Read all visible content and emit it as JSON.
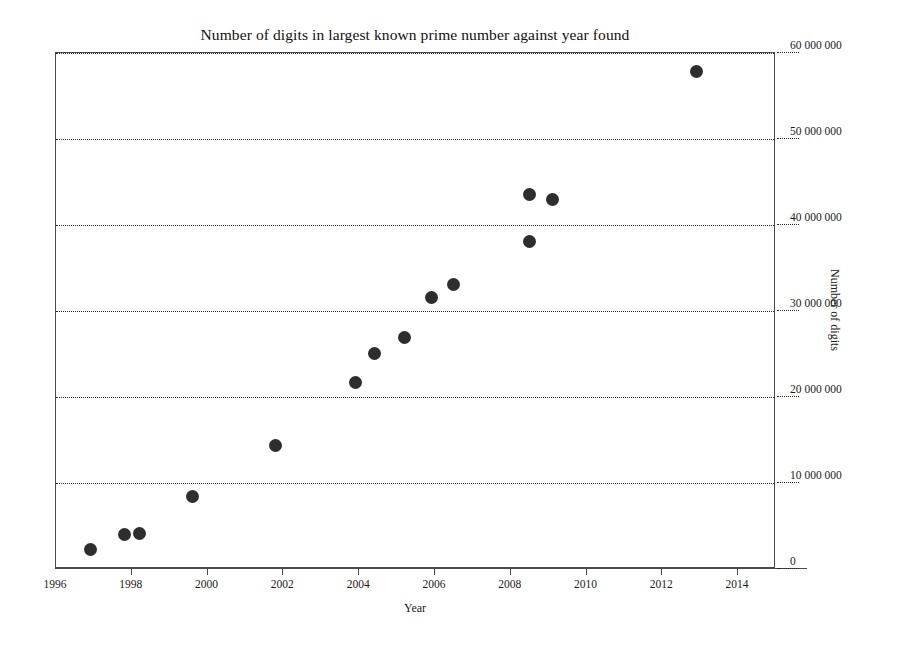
{
  "chart_data": {
    "type": "scatter",
    "title": "Number of digits in largest known prime number against year found",
    "xlabel": "Year",
    "ylabel": "Number of digits",
    "xlim": [
      1996,
      2015
    ],
    "ylim": [
      0,
      60000000
    ],
    "grid": true,
    "legend": null,
    "x_ticks": [
      1996,
      1998,
      2000,
      2002,
      2004,
      2006,
      2008,
      2010,
      2012,
      2014
    ],
    "x_tick_labels": [
      "1996",
      "1998",
      "2000",
      "2002",
      "2004",
      "2006",
      "2008",
      "2010",
      "2012",
      "2014"
    ],
    "y_ticks": [
      0,
      10000000,
      20000000,
      30000000,
      40000000,
      50000000,
      60000000
    ],
    "y_tick_labels": [
      "0",
      "10 000 000",
      "20 000 000",
      "30 000 000",
      "40 000 000",
      "50 000 000",
      "60 000 000"
    ],
    "marker_color": "#2e2e2e",
    "points": [
      {
        "x": 1996.9,
        "y": 2300000
      },
      {
        "x": 1997.8,
        "y": 4050000
      },
      {
        "x": 1998.2,
        "y": 4150000
      },
      {
        "x": 1999.6,
        "y": 8400000
      },
      {
        "x": 2001.8,
        "y": 14400000
      },
      {
        "x": 2003.9,
        "y": 21700000
      },
      {
        "x": 2004.4,
        "y": 25100000
      },
      {
        "x": 2005.2,
        "y": 26900000
      },
      {
        "x": 2005.9,
        "y": 31600000
      },
      {
        "x": 2006.5,
        "y": 33100000
      },
      {
        "x": 2008.5,
        "y": 38100000
      },
      {
        "x": 2008.5,
        "y": 43500000
      },
      {
        "x": 2009.1,
        "y": 43000000
      },
      {
        "x": 2012.9,
        "y": 57900000
      }
    ]
  }
}
